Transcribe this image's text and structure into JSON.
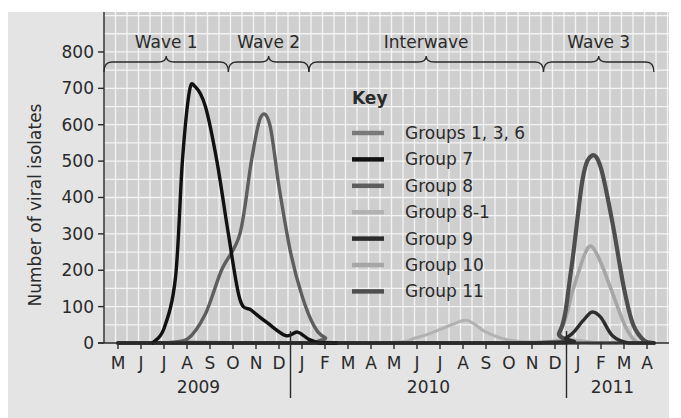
{
  "chart_data": {
    "type": "line",
    "title": "",
    "xlabel": "",
    "ylabel": "Number of viral isolates",
    "ylim": [
      0,
      800
    ],
    "yticks": [
      0,
      100,
      200,
      300,
      400,
      500,
      600,
      700,
      800
    ],
    "grid": true,
    "legend_position": "inside-center",
    "legend_title": "Key",
    "x": [
      "M",
      "J",
      "J",
      "A",
      "S",
      "O",
      "N",
      "D",
      "J",
      "F",
      "M",
      "A",
      "M",
      "J",
      "J",
      "A",
      "S",
      "O",
      "N",
      "D",
      "J",
      "F",
      "M",
      "A"
    ],
    "x_full": [
      "May 2009",
      "Jun 2009",
      "Jul 2009",
      "Aug 2009",
      "Sep 2009",
      "Oct 2009",
      "Nov 2009",
      "Dec 2009",
      "Jan 2010",
      "Feb 2010",
      "Mar 2010",
      "Apr 2010",
      "May 2010",
      "Jun 2010",
      "Jul 2010",
      "Aug 2010",
      "Sep 2010",
      "Oct 2010",
      "Nov 2010",
      "Dec 2010",
      "Jan 2011",
      "Feb 2011",
      "Mar 2011",
      "Apr 2011"
    ],
    "year_labels": [
      {
        "label": "2009",
        "start_index": 0,
        "end_index": 7
      },
      {
        "label": "2010",
        "start_index": 8,
        "end_index": 19
      },
      {
        "label": "2011",
        "start_index": 20,
        "end_index": 23
      }
    ],
    "periods": [
      {
        "label": "Wave 1",
        "from": -0.6,
        "to": 4.8
      },
      {
        "label": "Wave 2",
        "from": 4.8,
        "to": 8.3
      },
      {
        "label": "Interwave",
        "from": 8.3,
        "to": 18.5
      },
      {
        "label": "Wave 3",
        "from": 18.5,
        "to": 23.3
      }
    ],
    "series": [
      {
        "name": "Groups 1, 3, 6",
        "color": "#7a7a7a",
        "width": 3.2,
        "points": [
          [
            0,
            0
          ],
          [
            1.5,
            0
          ],
          [
            2.5,
            2
          ],
          [
            3.5,
            2
          ],
          [
            5,
            1
          ],
          [
            8,
            0
          ],
          [
            19,
            0
          ],
          [
            20,
            3
          ],
          [
            21,
            0
          ],
          [
            23.3,
            0
          ]
        ]
      },
      {
        "name": "Group 7",
        "color": "#111111",
        "width": 3.4,
        "points": [
          [
            1.5,
            0
          ],
          [
            2,
            40
          ],
          [
            2.5,
            180
          ],
          [
            2.8,
            500
          ],
          [
            3.1,
            690
          ],
          [
            3.35,
            705
          ],
          [
            3.8,
            650
          ],
          [
            4.3,
            500
          ],
          [
            4.8,
            300
          ],
          [
            5.3,
            120
          ],
          [
            5.8,
            90
          ],
          [
            6.5,
            55
          ],
          [
            7.3,
            20
          ],
          [
            7.8,
            30
          ],
          [
            8.3,
            10
          ],
          [
            8.8,
            0
          ],
          [
            9.5,
            0
          ]
        ]
      },
      {
        "name": "Group 8",
        "color": "#5e5e5e",
        "width": 3.4,
        "points": [
          [
            2,
            0
          ],
          [
            3,
            10
          ],
          [
            3.8,
            80
          ],
          [
            4.5,
            200
          ],
          [
            5.3,
            300
          ],
          [
            5.8,
            500
          ],
          [
            6.2,
            620
          ],
          [
            6.6,
            600
          ],
          [
            7,
            430
          ],
          [
            7.5,
            250
          ],
          [
            8,
            130
          ],
          [
            8.5,
            50
          ],
          [
            9,
            15
          ],
          [
            10,
            0
          ],
          [
            23.3,
            0
          ]
        ]
      },
      {
        "name": "Group 8-1",
        "color": "#b2b2b2",
        "width": 3.2,
        "points": [
          [
            0,
            0
          ],
          [
            11,
            0
          ],
          [
            13,
            15
          ],
          [
            14.5,
            50
          ],
          [
            15.2,
            62
          ],
          [
            16,
            30
          ],
          [
            17,
            8
          ],
          [
            18.5,
            2
          ],
          [
            19.5,
            10
          ],
          [
            21,
            0
          ],
          [
            23.3,
            0
          ]
        ]
      },
      {
        "name": "Group 9",
        "color": "#2c2c2c",
        "width": 3.4,
        "points": [
          [
            0,
            0
          ],
          [
            18,
            0
          ],
          [
            19.5,
            15
          ],
          [
            20.2,
            60
          ],
          [
            20.6,
            85
          ],
          [
            21,
            70
          ],
          [
            21.5,
            20
          ],
          [
            22.2,
            0
          ],
          [
            23.3,
            0
          ]
        ]
      },
      {
        "name": "Group 10",
        "color": "#a6a6a6",
        "width": 3.6,
        "points": [
          [
            0,
            0
          ],
          [
            18,
            0
          ],
          [
            19.2,
            30
          ],
          [
            19.8,
            150
          ],
          [
            20.3,
            245
          ],
          [
            20.6,
            265
          ],
          [
            21,
            220
          ],
          [
            21.6,
            120
          ],
          [
            22.1,
            40
          ],
          [
            22.6,
            0
          ],
          [
            23.3,
            0
          ]
        ]
      },
      {
        "name": "Group 11",
        "color": "#4e4e4e",
        "width": 4.2,
        "points": [
          [
            0,
            0
          ],
          [
            18,
            0
          ],
          [
            19.2,
            30
          ],
          [
            19.7,
            200
          ],
          [
            20.2,
            450
          ],
          [
            20.6,
            515
          ],
          [
            21,
            480
          ],
          [
            21.5,
            330
          ],
          [
            22,
            150
          ],
          [
            22.4,
            50
          ],
          [
            22.9,
            5
          ],
          [
            23.3,
            0
          ]
        ]
      }
    ]
  },
  "labels": {
    "y_axis_title": "Number of viral isolates",
    "legend_title": "Key"
  }
}
